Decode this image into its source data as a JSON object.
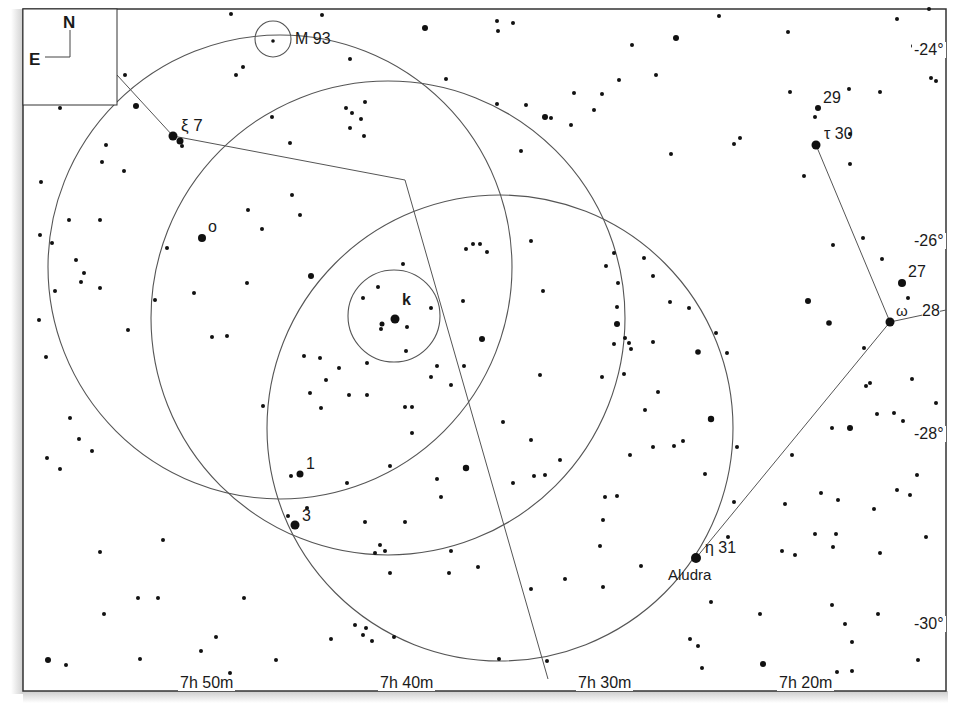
{
  "credit": "Megastar",
  "compass": {
    "north": "N",
    "east": "E"
  },
  "ra_labels": [
    {
      "text": "7h 50m",
      "x": 178
    },
    {
      "text": "7h 40m",
      "x": 378
    },
    {
      "text": "7h 30m",
      "x": 576
    },
    {
      "text": "7h 20m",
      "x": 777
    }
  ],
  "dec_labels": [
    {
      "text": "-24°",
      "y": 20
    },
    {
      "text": "-26°",
      "y": 240
    },
    {
      "text": "-28°",
      "y": 432
    },
    {
      "text": "-30°",
      "y": 622
    }
  ],
  "objects": {
    "m93": "M 93",
    "xi7": "ξ 7",
    "omicron": "o",
    "k": "k",
    "one": "1",
    "three": "3",
    "eta31": "η 31",
    "aludra": "Aludra",
    "tau30": "τ 30",
    "n29": "29",
    "n27": "27",
    "omega": "ω",
    "n28": "28"
  },
  "colors": {
    "ink": "#1a1a1a",
    "line": "#555555",
    "frame": "#333333"
  }
}
